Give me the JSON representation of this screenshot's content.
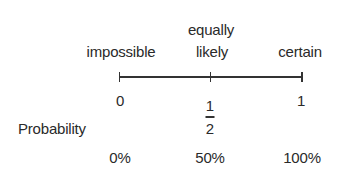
{
  "diagram": {
    "descriptors": [
      {
        "label": "impossible",
        "position": 0
      },
      {
        "label_line1": "equally",
        "label_line2": "likely",
        "position": 0.5
      },
      {
        "label": "certain",
        "position": 1
      }
    ],
    "row_label": "Probability",
    "numeric_values": [
      {
        "label": "0",
        "position": 0
      },
      {
        "numerator": "1",
        "denominator": "2",
        "position": 0.5
      },
      {
        "label": "1",
        "position": 1
      }
    ],
    "percentages": [
      {
        "label": "0%",
        "position": 0
      },
      {
        "label": "50%",
        "position": 0.5
      },
      {
        "label": "100%",
        "position": 1
      }
    ],
    "colors": {
      "line": "#333333",
      "text": "#2a2a2a",
      "background": "#ffffff"
    }
  }
}
